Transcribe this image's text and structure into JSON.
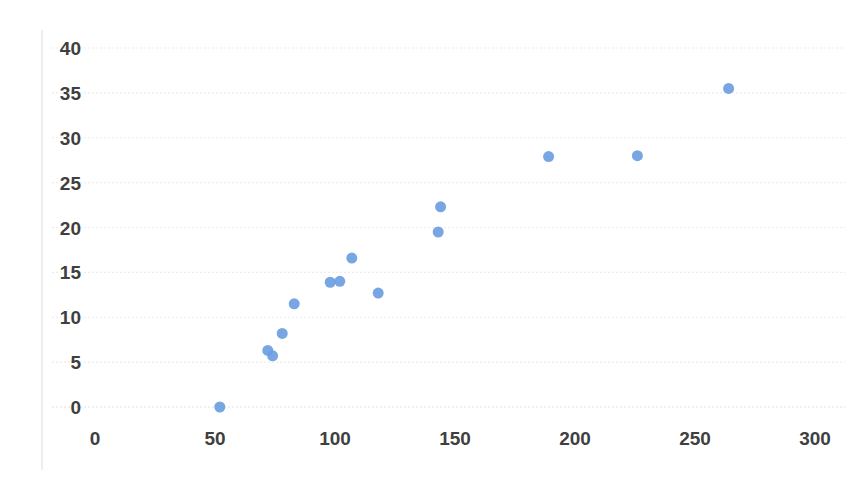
{
  "chart_data": {
    "type": "scatter",
    "title": "",
    "subtitle": "",
    "xlabel": "",
    "ylabel": "",
    "xlim": [
      0,
      300
    ],
    "ylim": [
      0,
      40
    ],
    "xticks": [
      0,
      50,
      100,
      150,
      200,
      250,
      300
    ],
    "yticks": [
      0,
      5,
      10,
      15,
      20,
      25,
      30,
      35,
      40
    ],
    "xtick_labels": [
      "0",
      "50",
      "100",
      "150",
      "200",
      "250",
      "300"
    ],
    "ytick_labels": [
      "0",
      "5",
      "10",
      "15",
      "20",
      "25",
      "30",
      "35",
      "40"
    ],
    "grid": true,
    "grid_axis": "y",
    "legend": null,
    "marker_color": "#6c9ee0",
    "marker_size": 11,
    "series": [
      {
        "name": "series-1",
        "points": [
          [
            52,
            0.0
          ],
          [
            72,
            6.3
          ],
          [
            74,
            5.7
          ],
          [
            78,
            8.2
          ],
          [
            83,
            11.5
          ],
          [
            98,
            13.9
          ],
          [
            102,
            14.0
          ],
          [
            107,
            16.6
          ],
          [
            118,
            12.7
          ],
          [
            143,
            19.5
          ],
          [
            144,
            22.3
          ],
          [
            189,
            27.9
          ],
          [
            226,
            28.0
          ],
          [
            264,
            35.5
          ]
        ]
      }
    ]
  },
  "axes": {
    "y_axis_name": "value-axis",
    "x_axis_name": "category-axis"
  }
}
